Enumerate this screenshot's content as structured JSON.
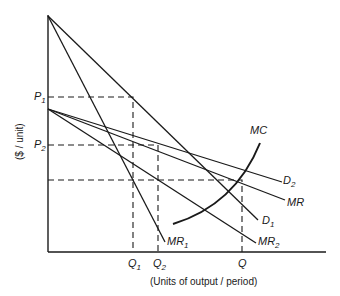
{
  "diagram": {
    "type": "economics-price-discrimination",
    "y_axis_label": "($ / unit)",
    "x_axis_label": "(Units of output / period)",
    "price_levels": [
      {
        "main": "P",
        "sub": "1"
      },
      {
        "main": "P",
        "sub": "2"
      }
    ],
    "quantity_levels": [
      {
        "main": "Q",
        "sub": "1"
      },
      {
        "main": "Q",
        "sub": "2"
      },
      {
        "main": "Q",
        "sub": ""
      }
    ],
    "curves": [
      {
        "main": "MC",
        "sub": ""
      },
      {
        "main": "D",
        "sub": "2"
      },
      {
        "main": "MR",
        "sub": ""
      },
      {
        "main": "D",
        "sub": "1"
      },
      {
        "main": "MR",
        "sub": "1"
      },
      {
        "main": "MR",
        "sub": "2"
      }
    ]
  }
}
